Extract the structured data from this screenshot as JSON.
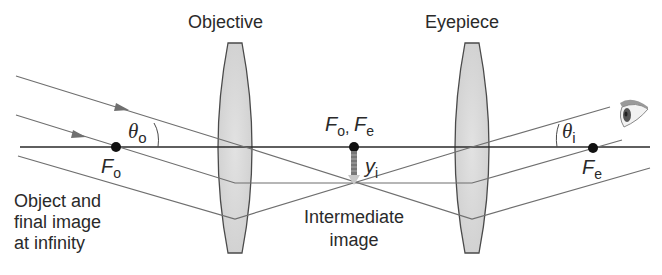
{
  "diagram": {
    "type": "refracting telescope ray diagram",
    "colors": {
      "ray": "#6f6f6f",
      "axis": "#2a2a2a",
      "lens_fill": "#d9d9d9",
      "lens_stroke": "#4a4a4a",
      "text": "#2a2a2a"
    },
    "lenses": [
      {
        "name": "objective",
        "label": "Objective"
      },
      {
        "name": "eyepiece",
        "label": "Eyepiece"
      }
    ],
    "labels": {
      "objective": "Objective",
      "eyepiece": "Eyepiece",
      "theta_o": {
        "symbol": "θ",
        "sub": "o"
      },
      "theta_i": {
        "symbol": "θ",
        "sub": "i"
      },
      "f_o_left": {
        "symbol": "F",
        "sub": "o"
      },
      "f_shared": {
        "symbol1": "F",
        "sub1": "o",
        "sep": ",",
        "symbol2": "F",
        "sub2": "e"
      },
      "y_i": {
        "symbol": "y",
        "sub": "i"
      },
      "f_e_right": {
        "symbol": "F",
        "sub": "e"
      },
      "object_caption": [
        "Object and",
        "final image",
        "at infinity"
      ],
      "intermediate_caption": [
        "Intermediate",
        "image"
      ]
    },
    "focal_points": [
      {
        "name": "F_o",
        "x": 116,
        "y": 147
      },
      {
        "name": "F_o, F_e",
        "x": 354,
        "y": 147
      },
      {
        "name": "F_e",
        "x": 593,
        "y": 147
      }
    ],
    "icons": {
      "eye": "eye-icon"
    }
  }
}
